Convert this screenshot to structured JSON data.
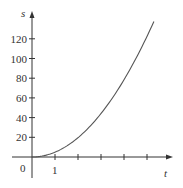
{
  "chart_data": {
    "type": "line",
    "title": "",
    "xlabel": "t",
    "ylabel": "s",
    "x_tick_labels": [
      "0",
      "1"
    ],
    "y_tick_labels": [
      "20",
      "40",
      "60",
      "80",
      "100",
      "120"
    ],
    "y_ticks": [
      20,
      40,
      60,
      80,
      100,
      120
    ],
    "x_ticks": [
      1,
      2,
      3,
      4,
      5
    ],
    "xlim": [
      0,
      6
    ],
    "ylim": [
      0,
      145
    ],
    "grid": false,
    "legend": null,
    "series": [
      {
        "name": "s(t)",
        "x": [
          0,
          0.5,
          1,
          1.5,
          2,
          2.5,
          3,
          3.5,
          4,
          4.5,
          5,
          5.3
        ],
        "values": [
          0,
          1.2,
          4.9,
          11,
          19.6,
          30.6,
          44.1,
          60,
          78.4,
          99.2,
          122.5,
          137.6
        ]
      }
    ],
    "color": "#555555"
  },
  "labels": {
    "origin": "0",
    "x_one": "1",
    "x_axis": "t",
    "y_axis": "s"
  }
}
